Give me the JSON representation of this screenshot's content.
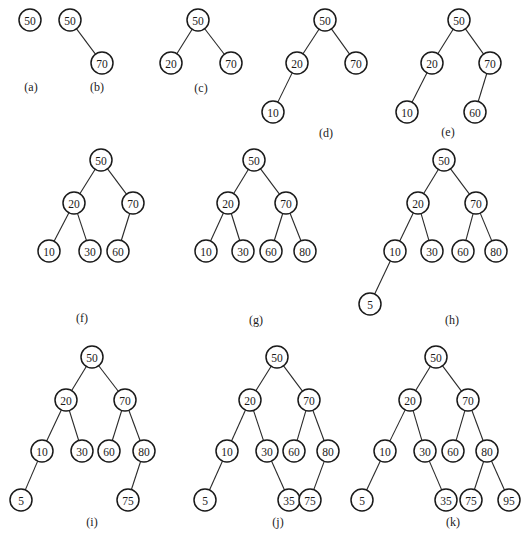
{
  "style": {
    "stroke_color": "#1a1a1a",
    "background": "#ffffff",
    "node_radius": 11
  },
  "panels": [
    {
      "id": "a",
      "label": "(a)",
      "label_pos": [
        31,
        87
      ],
      "nodes": [
        {
          "key": 50,
          "x": 30,
          "y": 20
        }
      ],
      "edges": []
    },
    {
      "id": "b",
      "label": "(b)",
      "label_pos": [
        97,
        87
      ],
      "nodes": [
        {
          "key": 50,
          "x": 70,
          "y": 20
        },
        {
          "key": 70,
          "x": 102,
          "y": 63
        }
      ],
      "edges": [
        [
          50,
          70
        ]
      ]
    },
    {
      "id": "c",
      "label": "(c)",
      "label_pos": [
        201,
        88
      ],
      "nodes": [
        {
          "key": 50,
          "x": 198,
          "y": 20
        },
        {
          "key": 20,
          "x": 171,
          "y": 63
        },
        {
          "key": 70,
          "x": 231,
          "y": 63
        }
      ],
      "edges": [
        [
          50,
          20
        ],
        [
          50,
          70
        ]
      ]
    },
    {
      "id": "d",
      "label": "(d)",
      "label_pos": [
        326,
        133
      ],
      "nodes": [
        {
          "key": 50,
          "x": 325,
          "y": 20
        },
        {
          "key": 20,
          "x": 297,
          "y": 63
        },
        {
          "key": 70,
          "x": 356,
          "y": 63
        },
        {
          "key": 10,
          "x": 273,
          "y": 112
        }
      ],
      "edges": [
        [
          50,
          20
        ],
        [
          50,
          70
        ],
        [
          20,
          10
        ]
      ]
    },
    {
      "id": "e",
      "label": "(e)",
      "label_pos": [
        448,
        132
      ],
      "nodes": [
        {
          "key": 50,
          "x": 459,
          "y": 20
        },
        {
          "key": 20,
          "x": 432,
          "y": 63
        },
        {
          "key": 70,
          "x": 490,
          "y": 63
        },
        {
          "key": 10,
          "x": 407,
          "y": 112
        },
        {
          "key": 60,
          "x": 475,
          "y": 112
        }
      ],
      "edges": [
        [
          50,
          20
        ],
        [
          50,
          70
        ],
        [
          20,
          10
        ],
        [
          70,
          60
        ]
      ]
    },
    {
      "id": "f",
      "label": "(f)",
      "label_pos": [
        82,
        318
      ],
      "nodes": [
        {
          "key": 50,
          "x": 101,
          "y": 160
        },
        {
          "key": 20,
          "x": 74,
          "y": 203
        },
        {
          "key": 70,
          "x": 133,
          "y": 203
        },
        {
          "key": 10,
          "x": 49,
          "y": 251
        },
        {
          "key": 30,
          "x": 90,
          "y": 251
        },
        {
          "key": 60,
          "x": 118,
          "y": 251
        }
      ],
      "edges": [
        [
          50,
          20
        ],
        [
          50,
          70
        ],
        [
          20,
          10
        ],
        [
          20,
          30
        ],
        [
          70,
          60
        ]
      ]
    },
    {
      "id": "g",
      "label": "(g)",
      "label_pos": [
        256,
        320
      ],
      "nodes": [
        {
          "key": 50,
          "x": 254,
          "y": 160
        },
        {
          "key": 20,
          "x": 228,
          "y": 203
        },
        {
          "key": 70,
          "x": 286,
          "y": 203
        },
        {
          "key": 10,
          "x": 206,
          "y": 251
        },
        {
          "key": 30,
          "x": 243,
          "y": 251
        },
        {
          "key": 60,
          "x": 271,
          "y": 251
        },
        {
          "key": 80,
          "x": 305,
          "y": 251
        }
      ],
      "edges": [
        [
          50,
          20
        ],
        [
          50,
          70
        ],
        [
          20,
          10
        ],
        [
          20,
          30
        ],
        [
          70,
          60
        ],
        [
          70,
          80
        ]
      ]
    },
    {
      "id": "h",
      "label": "(h)",
      "label_pos": [
        452,
        320
      ],
      "nodes": [
        {
          "key": 50,
          "x": 444,
          "y": 160
        },
        {
          "key": 20,
          "x": 418,
          "y": 203
        },
        {
          "key": 70,
          "x": 476,
          "y": 203
        },
        {
          "key": 10,
          "x": 395,
          "y": 251
        },
        {
          "key": 30,
          "x": 432,
          "y": 251
        },
        {
          "key": 60,
          "x": 463,
          "y": 251
        },
        {
          "key": 80,
          "x": 496,
          "y": 251
        },
        {
          "key": 5,
          "x": 370,
          "y": 304
        }
      ],
      "edges": [
        [
          50,
          20
        ],
        [
          50,
          70
        ],
        [
          20,
          10
        ],
        [
          20,
          30
        ],
        [
          70,
          60
        ],
        [
          70,
          80
        ],
        [
          10,
          5
        ]
      ]
    },
    {
      "id": "i",
      "label": "(i)",
      "label_pos": [
        92,
        522
      ],
      "nodes": [
        {
          "key": 50,
          "x": 92,
          "y": 357
        },
        {
          "key": 20,
          "x": 66,
          "y": 400
        },
        {
          "key": 70,
          "x": 125,
          "y": 400
        },
        {
          "key": 10,
          "x": 42,
          "y": 451
        },
        {
          "key": 30,
          "x": 82,
          "y": 451
        },
        {
          "key": 60,
          "x": 109,
          "y": 451
        },
        {
          "key": 80,
          "x": 144,
          "y": 451
        },
        {
          "key": 5,
          "x": 21,
          "y": 500
        },
        {
          "key": 75,
          "x": 128,
          "y": 500
        }
      ],
      "edges": [
        [
          50,
          20
        ],
        [
          50,
          70
        ],
        [
          20,
          10
        ],
        [
          20,
          30
        ],
        [
          70,
          60
        ],
        [
          70,
          80
        ],
        [
          10,
          5
        ],
        [
          80,
          75
        ]
      ]
    },
    {
      "id": "j",
      "label": "(j)",
      "label_pos": [
        278,
        522
      ],
      "nodes": [
        {
          "key": 50,
          "x": 277,
          "y": 357
        },
        {
          "key": 20,
          "x": 250,
          "y": 400
        },
        {
          "key": 70,
          "x": 309,
          "y": 400
        },
        {
          "key": 10,
          "x": 227,
          "y": 451
        },
        {
          "key": 30,
          "x": 267,
          "y": 451
        },
        {
          "key": 60,
          "x": 294,
          "y": 451
        },
        {
          "key": 80,
          "x": 328,
          "y": 451
        },
        {
          "key": 5,
          "x": 205,
          "y": 500
        },
        {
          "key": 35,
          "x": 289,
          "y": 500
        },
        {
          "key": 75,
          "x": 310,
          "y": 500
        }
      ],
      "edges": [
        [
          50,
          20
        ],
        [
          50,
          70
        ],
        [
          20,
          10
        ],
        [
          20,
          30
        ],
        [
          70,
          60
        ],
        [
          70,
          80
        ],
        [
          10,
          5
        ],
        [
          30,
          35
        ],
        [
          80,
          75
        ]
      ]
    },
    {
      "id": "k",
      "label": "(k)",
      "label_pos": [
        453,
        522
      ],
      "nodes": [
        {
          "key": 50,
          "x": 436,
          "y": 357
        },
        {
          "key": 20,
          "x": 410,
          "y": 400
        },
        {
          "key": 70,
          "x": 468,
          "y": 400
        },
        {
          "key": 10,
          "x": 385,
          "y": 451
        },
        {
          "key": 30,
          "x": 425,
          "y": 451
        },
        {
          "key": 60,
          "x": 453,
          "y": 451
        },
        {
          "key": 80,
          "x": 487,
          "y": 451
        },
        {
          "key": 5,
          "x": 362,
          "y": 500
        },
        {
          "key": 35,
          "x": 446,
          "y": 500
        },
        {
          "key": 75,
          "x": 471,
          "y": 500
        },
        {
          "key": 95,
          "x": 509,
          "y": 500
        }
      ],
      "edges": [
        [
          50,
          20
        ],
        [
          50,
          70
        ],
        [
          20,
          10
        ],
        [
          20,
          30
        ],
        [
          70,
          60
        ],
        [
          70,
          80
        ],
        [
          10,
          5
        ],
        [
          30,
          35
        ],
        [
          80,
          75
        ],
        [
          80,
          95
        ]
      ]
    }
  ]
}
